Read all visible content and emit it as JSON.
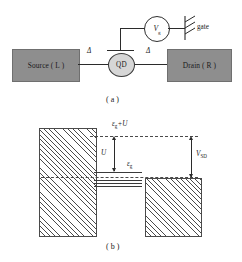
{
  "figure": {
    "panel_a": {
      "caption": "( a )",
      "source_label": "Source ( L )",
      "drain_label": "Drain ( R )",
      "dot_label": "QD",
      "gate_label": "gate",
      "voltage_source": {
        "symbol": "V",
        "subscript": "g"
      },
      "tunnel_barrier_left": "Δ",
      "tunnel_barrier_right": "Δ"
    },
    "panel_b": {
      "caption": "( b )",
      "upper_level_label": "ε",
      "upper_level_sub": "g",
      "upper_level_suffix": "+U",
      "charging_energy_label": "U",
      "dot_level_label": "ε",
      "dot_level_sub": "g",
      "bias_label": "V",
      "bias_sub": "SD"
    }
  },
  "colors": {
    "lead_fill": "#8e8e8e",
    "lead_stroke": "#6f6f6f",
    "dot_fill": "#d6d6d6",
    "line": "#2b2b2b",
    "hatch": "#4a4a4a",
    "background": "#ffffff"
  }
}
